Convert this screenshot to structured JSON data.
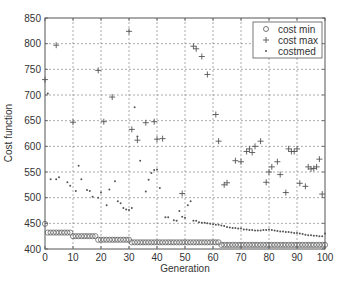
{
  "chart_data": {
    "type": "scatter",
    "title": "",
    "xlabel": "Generation",
    "ylabel": "Cost function",
    "xlim": [
      0,
      100
    ],
    "ylim": [
      400,
      850
    ],
    "xticks": [
      0,
      10,
      20,
      30,
      40,
      50,
      60,
      70,
      80,
      90,
      100
    ],
    "yticks": [
      400,
      450,
      500,
      550,
      600,
      650,
      700,
      750,
      800,
      850
    ],
    "grid": true,
    "legend_position": "upper right",
    "series": [
      {
        "name": "cost min",
        "marker": "circle",
        "x": [
          0,
          1,
          2,
          3,
          4,
          5,
          6,
          7,
          8,
          9,
          10,
          11,
          12,
          13,
          14,
          15,
          16,
          17,
          18,
          19,
          20,
          21,
          22,
          23,
          24,
          25,
          26,
          27,
          28,
          29,
          30,
          31,
          32,
          33,
          34,
          35,
          36,
          37,
          38,
          39,
          40,
          41,
          42,
          43,
          44,
          45,
          46,
          47,
          48,
          49,
          50,
          51,
          52,
          53,
          54,
          55,
          56,
          57,
          58,
          59,
          60,
          61,
          62,
          63,
          64,
          65,
          66,
          67,
          68,
          69,
          70,
          71,
          72,
          73,
          74,
          75,
          76,
          77,
          78,
          79,
          80,
          81,
          82,
          83,
          84,
          85,
          86,
          87,
          88,
          89,
          90,
          91,
          92,
          93,
          94,
          95,
          96,
          97,
          98,
          99,
          100
        ],
        "values": [
          449,
          432,
          432,
          432,
          432,
          432,
          432,
          432,
          432,
          432,
          425,
          425,
          425,
          425,
          425,
          425,
          425,
          425,
          425,
          418,
          418,
          418,
          418,
          418,
          418,
          418,
          418,
          418,
          418,
          418,
          418,
          413,
          413,
          413,
          413,
          413,
          413,
          413,
          413,
          413,
          413,
          413,
          413,
          413,
          413,
          413,
          413,
          413,
          413,
          413,
          413,
          413,
          413,
          413,
          413,
          413,
          413,
          413,
          413,
          413,
          413,
          413,
          413,
          408,
          408,
          408,
          408,
          408,
          408,
          408,
          408,
          408,
          408,
          408,
          408,
          408,
          408,
          408,
          408,
          408,
          408,
          408,
          408,
          408,
          408,
          408,
          408,
          408,
          408,
          408,
          408,
          408,
          408,
          408,
          408,
          408,
          408,
          408,
          408,
          408,
          408
        ]
      },
      {
        "name": "cost max",
        "marker": "plus",
        "x": [
          0,
          4,
          10,
          19,
          21,
          24,
          30,
          31,
          33,
          36,
          39,
          40,
          42,
          49,
          53,
          54,
          56,
          58,
          61,
          62,
          64,
          65,
          68,
          70,
          72,
          73,
          74,
          75,
          77,
          79,
          80,
          81,
          83,
          84,
          86,
          87,
          88,
          89,
          90,
          91,
          93,
          94,
          95,
          96,
          97,
          98,
          99
        ],
        "values": [
          730,
          797,
          647,
          748,
          648,
          696,
          824,
          633,
          612,
          646,
          648,
          614,
          615,
          508,
          795,
          790,
          775,
          740,
          662,
          610,
          525,
          529,
          572,
          570,
          590,
          595,
          588,
          600,
          610,
          530,
          550,
          560,
          570,
          545,
          510,
          595,
          590,
          590,
          595,
          528,
          522,
          560,
          556,
          557,
          560,
          575,
          507
        ]
      },
      {
        "name": "costmed",
        "marker": "dot",
        "x": [
          1,
          2,
          4,
          5,
          8,
          9,
          11,
          12,
          13,
          15,
          16,
          17,
          19,
          20,
          22,
          23,
          25,
          26,
          27,
          28,
          29,
          30,
          31,
          32,
          33,
          34,
          36,
          37,
          38,
          39,
          40,
          41,
          43,
          44,
          46,
          47,
          48,
          49,
          50,
          51,
          52,
          53,
          54,
          55,
          56,
          57,
          58,
          59,
          60,
          61,
          62,
          63,
          64,
          65,
          66,
          67,
          68,
          69,
          70,
          71,
          72,
          73,
          74,
          75,
          76,
          77,
          78,
          79,
          80,
          81,
          82,
          83,
          84,
          85,
          86,
          87,
          88,
          89,
          90,
          91,
          92,
          93,
          94,
          95,
          96,
          97,
          98,
          99,
          100
        ],
        "values": [
          703,
          536,
          536,
          540,
          530,
          523,
          513,
          562,
          536,
          515,
          513,
          502,
          500,
          510,
          485,
          516,
          532,
          493,
          489,
          480,
          477,
          476,
          480,
          676,
          619,
          572,
          512,
          535,
          548,
          554,
          555,
          519,
          462,
          462,
          456,
          455,
          474,
          463,
          461,
          485,
          493,
          455,
          455,
          452,
          451,
          451,
          450,
          449,
          448,
          447,
          447,
          446,
          445,
          443,
          442,
          441,
          441,
          440,
          440,
          438,
          438,
          437,
          437,
          436,
          436,
          436,
          437,
          437,
          438,
          437,
          436,
          435,
          434,
          434,
          433,
          433,
          432,
          431,
          431,
          430,
          429,
          428,
          427,
          427,
          426,
          426,
          425,
          425,
          430
        ]
      }
    ]
  },
  "legend": {
    "items": [
      {
        "label": "cost min",
        "symbol": "o"
      },
      {
        "label": "cost max",
        "symbol": "+"
      },
      {
        "label": "costmed",
        "symbol": "·"
      }
    ]
  },
  "axes": {
    "xlabel": "Generation",
    "ylabel": "Cost function"
  },
  "colors": {
    "marker": "#555555",
    "axis": "#555555",
    "grid": "#888888",
    "text": "#333333"
  }
}
